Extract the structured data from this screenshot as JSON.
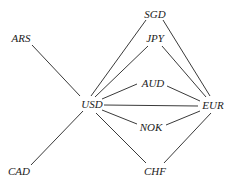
{
  "diagram": {
    "type": "graph",
    "nodes": [
      {
        "id": "SGD",
        "label": "SGD",
        "x": 155,
        "y": 15
      },
      {
        "id": "JPY",
        "label": "JPY",
        "x": 155,
        "y": 39
      },
      {
        "id": "ARS",
        "label": "ARS",
        "x": 21,
        "y": 39
      },
      {
        "id": "AUD",
        "label": "AUD",
        "x": 153,
        "y": 84
      },
      {
        "id": "USD",
        "label": "USD",
        "x": 92,
        "y": 105
      },
      {
        "id": "EUR",
        "label": "EUR",
        "x": 213,
        "y": 106
      },
      {
        "id": "NOK",
        "label": "NOK",
        "x": 151,
        "y": 128
      },
      {
        "id": "CAD",
        "label": "CAD",
        "x": 19,
        "y": 172
      },
      {
        "id": "CHF",
        "label": "CHF",
        "x": 155,
        "y": 172
      }
    ],
    "edges": [
      {
        "from": "ARS",
        "to": "USD",
        "x1": 32,
        "y1": 45,
        "x2": 80,
        "y2": 96
      },
      {
        "from": "CAD",
        "to": "USD",
        "x1": 31,
        "y1": 165,
        "x2": 83,
        "y2": 111
      },
      {
        "from": "USD",
        "to": "SGD",
        "x1": 91,
        "y1": 96,
        "x2": 146,
        "y2": 20
      },
      {
        "from": "USD",
        "to": "JPY",
        "x1": 95,
        "y1": 97,
        "x2": 148,
        "y2": 46
      },
      {
        "from": "USD",
        "to": "AUD",
        "x1": 102,
        "y1": 99,
        "x2": 137,
        "y2": 84
      },
      {
        "from": "USD",
        "to": "EUR",
        "x1": 104,
        "y1": 105,
        "x2": 198,
        "y2": 106
      },
      {
        "from": "USD",
        "to": "NOK",
        "x1": 102,
        "y1": 110,
        "x2": 137,
        "y2": 124
      },
      {
        "from": "USD",
        "to": "CHF",
        "x1": 96,
        "y1": 113,
        "x2": 146,
        "y2": 163
      },
      {
        "from": "SGD",
        "to": "EUR",
        "x1": 163,
        "y1": 20,
        "x2": 210,
        "y2": 96
      },
      {
        "from": "JPY",
        "to": "EUR",
        "x1": 162,
        "y1": 46,
        "x2": 206,
        "y2": 97
      },
      {
        "from": "AUD",
        "to": "EUR",
        "x1": 167,
        "y1": 86,
        "x2": 200,
        "y2": 101
      },
      {
        "from": "NOK",
        "to": "EUR",
        "x1": 166,
        "y1": 125,
        "x2": 200,
        "y2": 111
      },
      {
        "from": "CHF",
        "to": "EUR",
        "x1": 164,
        "y1": 163,
        "x2": 211,
        "y2": 113
      }
    ]
  }
}
